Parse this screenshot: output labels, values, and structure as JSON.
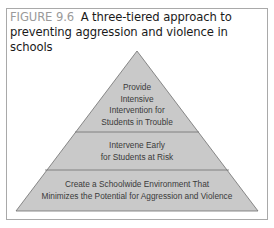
{
  "figure": {
    "label": "FIGURE 9.6",
    "title": "A three-tiered approach to preventing aggression and violence in schools"
  },
  "pyramid": {
    "fill_color": "#c9c9c9",
    "stroke_color": "#6e6e6e",
    "tiers": [
      {
        "position": "top",
        "lines": [
          "Provide",
          "Intensive",
          "Intervention for",
          "Students in Trouble"
        ]
      },
      {
        "position": "middle",
        "lines": [
          "Intervene Early",
          "for Students at Risk"
        ]
      },
      {
        "position": "bottom",
        "lines": [
          "Create a Schoolwide Environment That",
          "Minimizes the Potential for Aggression and Violence"
        ]
      }
    ]
  }
}
